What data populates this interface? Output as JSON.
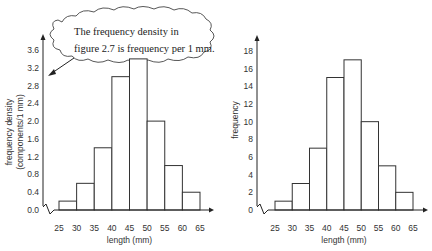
{
  "callout": {
    "line1": "The frequency density in",
    "line2": "figure 2.7 is frequency per 1 mm."
  },
  "chart_data": [
    {
      "type": "bar",
      "title": "",
      "xlabel": "length (mm)",
      "ylabel_line1": "frequency density",
      "ylabel_line2": "(components/1 mm)",
      "bin_edges": [
        25,
        30,
        35,
        40,
        45,
        50,
        55,
        60,
        65
      ],
      "categories": [
        "25-30",
        "30-35",
        "35-40",
        "40-45",
        "45-50",
        "50-55",
        "55-60",
        "60-65"
      ],
      "values": [
        0.2,
        0.6,
        1.4,
        3.0,
        3.4,
        2.0,
        1.0,
        0.4
      ],
      "yticks": [
        "0.0",
        "0.4",
        "0.8",
        "1.2",
        "1.6",
        "2.0",
        "2.4",
        "2.8",
        "3.2",
        "3.6"
      ],
      "ylim": [
        0,
        3.6
      ],
      "grid": false,
      "axis_break": true
    },
    {
      "type": "bar",
      "title": "",
      "xlabel": "length (mm)",
      "ylabel_line1": "frequency",
      "ylabel_line2": "",
      "bin_edges": [
        25,
        30,
        35,
        40,
        45,
        50,
        55,
        60,
        65
      ],
      "categories": [
        "25-30",
        "30-35",
        "35-40",
        "40-45",
        "45-50",
        "50-55",
        "55-60",
        "60-65"
      ],
      "values": [
        1,
        3,
        7,
        15,
        17,
        10,
        5,
        2
      ],
      "yticks": [
        "0",
        "2",
        "4",
        "6",
        "8",
        "10",
        "12",
        "14",
        "16",
        "18"
      ],
      "ylim": [
        0,
        18
      ],
      "grid": false,
      "axis_break": true
    }
  ]
}
